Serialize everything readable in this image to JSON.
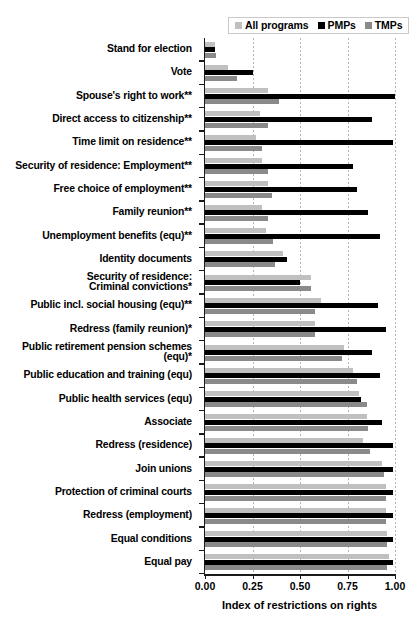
{
  "legend": {
    "items": [
      {
        "label": "All programs",
        "color": "#c0c0c0",
        "key": "all_programs"
      },
      {
        "label": "PMPs",
        "color": "#000000",
        "key": "pmps"
      },
      {
        "label": "TMPs",
        "color": "#8a8a8a",
        "key": "tmps"
      }
    ]
  },
  "axis": {
    "xlabel": "Index of restrictions on rights",
    "ticks": [
      "0.00",
      "0.25",
      "0.50",
      "0.75",
      "1.00"
    ],
    "tickvalues": [
      0,
      0.25,
      0.5,
      0.75,
      1.0
    ]
  },
  "chart_data": {
    "type": "bar",
    "orientation": "horizontal",
    "title": "",
    "xlabel": "Index of restrictions on rights",
    "ylabel": "",
    "xlim": [
      0,
      1.0
    ],
    "grid": true,
    "legend_position": "top-right",
    "categories": [
      "Stand for election",
      "Vote",
      "Spouse's right to work**",
      "Direct access to citizenship**",
      "Time limit on residence**",
      "Security of residence: Employment**",
      "Free choice of employment**",
      "Family reunion**",
      "Unemployment benefits (equ)**",
      "Identity documents",
      "Security of residence:\nCriminal convictions*",
      "Public incl. social housing (equ)**",
      "Redress (family reunion)*",
      "Public retirement pension schemes\n(equ)*",
      "Public education and training (equ)",
      "Public health services (equ)",
      "Associate",
      "Redress (residence)",
      "Join unions",
      "Protection of criminal courts",
      "Redress (employment)",
      "Equal conditions",
      "Equal pay"
    ],
    "series": [
      {
        "name": "All programs",
        "color": "#c0c0c0",
        "values": [
          0.05,
          0.12,
          0.33,
          0.29,
          0.27,
          0.3,
          0.33,
          0.3,
          0.32,
          0.41,
          0.56,
          0.61,
          0.58,
          0.73,
          0.78,
          0.81,
          0.85,
          0.83,
          0.93,
          0.95,
          0.95,
          0.96,
          0.97
        ]
      },
      {
        "name": "PMPs",
        "color": "#000000",
        "values": [
          0.05,
          0.25,
          1.0,
          0.88,
          0.99,
          0.78,
          0.8,
          0.86,
          0.92,
          0.43,
          0.5,
          0.91,
          0.95,
          0.88,
          0.92,
          0.82,
          0.93,
          0.99,
          0.99,
          0.99,
          0.99,
          0.99,
          0.99
        ]
      },
      {
        "name": "TMPs",
        "color": "#8a8a8a",
        "values": [
          0.06,
          0.17,
          0.39,
          0.33,
          0.3,
          0.33,
          0.35,
          0.33,
          0.36,
          0.37,
          0.56,
          0.58,
          0.58,
          0.72,
          0.8,
          0.85,
          0.86,
          0.87,
          0.94,
          0.95,
          0.95,
          0.96,
          0.96
        ]
      }
    ]
  }
}
